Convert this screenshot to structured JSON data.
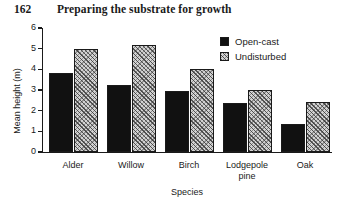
{
  "page": {
    "folio": "162",
    "running_title": "Preparing the substrate for growth"
  },
  "chart_data": {
    "type": "bar",
    "title": "",
    "xlabel": "Species",
    "ylabel": "Mean height (m)",
    "categories": [
      "Alder",
      "Willow",
      "Birch",
      "Lodgepole pine",
      "Oak"
    ],
    "category_lines": [
      [
        "Alder"
      ],
      [
        "Willow"
      ],
      [
        "Birch"
      ],
      [
        "Lodgepole",
        "pine"
      ],
      [
        "Oak"
      ]
    ],
    "series": [
      {
        "name": "Open-cast",
        "fill": "solid-black",
        "color": "#111111",
        "values": [
          3.8,
          3.25,
          2.95,
          2.35,
          1.35
        ]
      },
      {
        "name": "Undisturbed",
        "fill": "diagonal-hatch",
        "color": "#d2d2d2",
        "values": [
          5.0,
          5.2,
          4.0,
          3.0,
          2.4
        ]
      }
    ],
    "ylim": [
      0,
      6
    ],
    "yticks": [
      0,
      1,
      2,
      3,
      4,
      5,
      6
    ],
    "ytick_labels": [
      "0",
      "1",
      "2",
      "3",
      "4",
      "5",
      "6"
    ],
    "grid": false,
    "legend_position": "top-right",
    "legend_entries": [
      "Open-cast",
      "Undisturbed"
    ]
  }
}
